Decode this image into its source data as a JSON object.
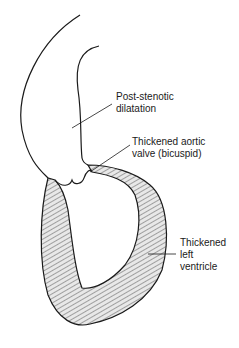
{
  "diagram": {
    "labels": [
      {
        "id": "post-stenotic",
        "lines": [
          "Post-stenotic",
          "dilatation"
        ]
      },
      {
        "id": "aortic-valve",
        "lines": [
          "Thickened aortic",
          "valve (bicuspid)"
        ]
      },
      {
        "id": "left-ventricle",
        "lines": [
          "Thickened",
          "left",
          "ventricle"
        ]
      }
    ],
    "colors": {
      "line": "#1a1a1a",
      "background": "#ffffff",
      "hatch": "#555555"
    }
  }
}
